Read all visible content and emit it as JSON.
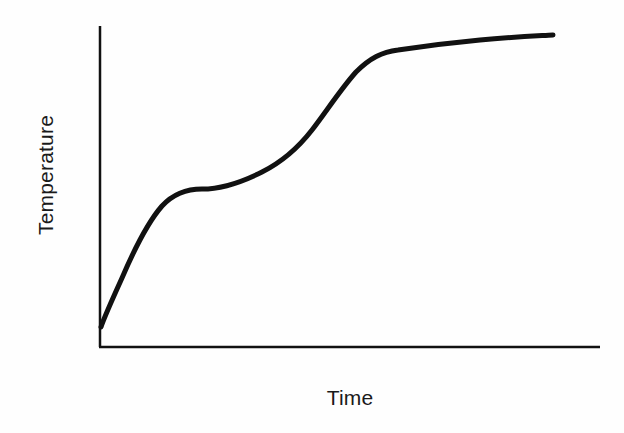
{
  "figure": {
    "background_color": "#fefefe",
    "ink_color": "#111111",
    "width": 624,
    "height": 433
  },
  "chart_data": {
    "type": "line",
    "title": "",
    "subtitle": "",
    "xlabel": "Time",
    "ylabel": "Temperature",
    "x": [
      0,
      2,
      5,
      9,
      14,
      20,
      27,
      34,
      41,
      48,
      55,
      62,
      68,
      74,
      80,
      86,
      92,
      100
    ],
    "y": [
      3,
      10,
      26,
      42,
      52,
      57,
      60,
      64,
      70,
      79,
      88,
      94,
      96,
      97,
      98,
      98.5,
      99,
      100
    ],
    "series": [
      {
        "name": "Heating curve",
        "values": [
          3,
          10,
          26,
          42,
          52,
          57,
          60,
          64,
          70,
          79,
          88,
          94,
          96,
          97,
          98,
          98.5,
          99,
          100
        ]
      }
    ],
    "xlim": [
      0,
      100
    ],
    "ylim": [
      0,
      100
    ],
    "xticks": [],
    "yticks": [],
    "xticklabels": [],
    "yticklabels": [],
    "grid": false,
    "legend": false,
    "legend_position": "none",
    "annotations": [],
    "line_color": "#111111",
    "line_width": 5,
    "axis_color": "#111111",
    "axis_width": 2.5
  },
  "axes": {
    "y_axis": {
      "x": 100,
      "y_top": 26,
      "y_bottom": 347
    },
    "x_axis": {
      "y": 347,
      "x_left": 100,
      "x_right": 600
    }
  },
  "curve": {
    "path": "M 101 327 C 104 318, 112 300, 122 278 C 134 250, 148 222, 162 206 C 174 193, 188 189, 202 189 C 222 189, 244 181, 262 172 C 282 162, 298 148, 312 130 C 326 112, 340 90, 356 72 C 370 58, 382 52, 398 50 C 418 47, 448 43, 480 40 C 512 37, 536 36, 553 35"
  }
}
